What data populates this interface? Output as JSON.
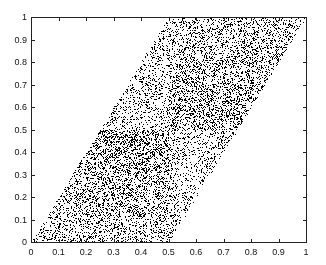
{
  "chart_data": {
    "type": "scatter",
    "title": "",
    "xlabel": "",
    "ylabel": "",
    "xlim": [
      0,
      1
    ],
    "ylim": [
      0,
      1
    ],
    "grid": false,
    "legend": null,
    "x_ticks": [
      "0",
      "0.1",
      "0.2",
      "0.3",
      "0.4",
      "0.5",
      "0.6",
      "0.7",
      "0.8",
      "0.9",
      "1"
    ],
    "y_ticks": [
      "0",
      "0.1",
      "0.2",
      "0.3",
      "0.4",
      "0.5",
      "0.6",
      "0.7",
      "0.8",
      "0.9",
      "1"
    ],
    "marker_color": "#000000",
    "region": {
      "shape": "parallelogram",
      "vertices": [
        [
          0,
          0
        ],
        [
          0.5,
          0
        ],
        [
          1,
          1
        ],
        [
          0.5,
          1
        ]
      ],
      "description": "Points fill the parallelogram bounded by y=2x (left), y=2x-1 (right), y=0 and y=1"
    },
    "quadrants": [
      {
        "name": "bottom-left",
        "x_range": [
          0,
          0.5
        ],
        "y_range": [
          0,
          0.5
        ],
        "density": "high",
        "gradient": "darkest near y=0.5"
      },
      {
        "name": "bottom-right",
        "x_range": [
          0.5,
          1
        ],
        "y_range": [
          0,
          0.5
        ],
        "density": "low"
      },
      {
        "name": "top-left",
        "x_range": [
          0,
          0.5
        ],
        "y_range": [
          0.5,
          1
        ],
        "density": "low"
      },
      {
        "name": "top-right",
        "x_range": [
          0.5,
          1
        ],
        "y_range": [
          0.5,
          1
        ],
        "density": "high",
        "gradient": "darkest near y=0.5"
      }
    ],
    "density_weights": {
      "high": 1.0,
      "low": 0.45
    },
    "approx_point_count": 14000
  }
}
